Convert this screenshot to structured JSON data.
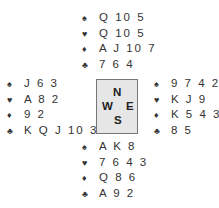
{
  "north": {
    "spades": "Q 10 5",
    "hearts": "Q 10 5",
    "diamonds": "A J 10 7",
    "clubs": "7 6 4"
  },
  "west": {
    "spades": "J 6 3",
    "hearts": "A 8 2",
    "diamonds": "9 2",
    "clubs": "K Q J 10 3"
  },
  "east": {
    "spades": "9 7 4 2",
    "hearts": "K J 9",
    "diamonds": "K 5 4 3",
    "clubs": "8 5"
  },
  "south": {
    "spades": "A K 8",
    "hearts": "7 6 4 3",
    "diamonds": "Q 8 6",
    "clubs": "A 9 2"
  },
  "compass": {
    "n": "N",
    "w": "W",
    "e": "E",
    "s": "S"
  },
  "symbols": {
    "spades": "♠",
    "hearts": "♥",
    "diamonds": "♦",
    "clubs": "♣"
  }
}
